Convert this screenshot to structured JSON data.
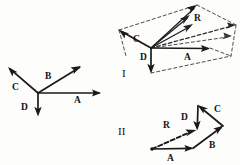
{
  "figure": {
    "kind": "hand-drawn-vector-diagram",
    "background_color": "#fdfdfc",
    "ink_color": "#1a1a1a",
    "panel_count": 3,
    "panels": [
      {
        "id": "panel-left",
        "caption": "",
        "description": "Four vectors A, B, C, D drawn from a common origin (tail-to-tail star arrangement)",
        "origin": {
          "x": 38,
          "y": 93
        },
        "vectors": [
          {
            "name": "A",
            "label": "A",
            "label_x": 74,
            "label_y": 103,
            "from": {
              "x": 38,
              "y": 93
            },
            "to": {
              "x": 101,
              "y": 93
            },
            "style": "solid",
            "direction_deg": 0
          },
          {
            "name": "B",
            "label": "B",
            "label_x": 45,
            "label_y": 79,
            "from": {
              "x": 38,
              "y": 93
            },
            "to": {
              "x": 81,
              "y": 66
            },
            "style": "solid",
            "direction_deg": 32
          },
          {
            "name": "C",
            "label": "C",
            "label_x": 12,
            "label_y": 90,
            "from": {
              "x": 38,
              "y": 93
            },
            "to": {
              "x": 8,
              "y": 67
            },
            "style": "solid",
            "direction_deg": 139
          },
          {
            "name": "D",
            "label": "D",
            "label_x": 22,
            "label_y": 110,
            "from": {
              "x": 38,
              "y": 93
            },
            "to": {
              "x": 38,
              "y": 116
            },
            "style": "solid",
            "direction_deg": 270
          }
        ]
      },
      {
        "id": "panel-one",
        "caption": "I",
        "caption_x": 122,
        "caption_y": 76,
        "description": "Parallelepiped construction: vectors A, C, D from a common origin with dashed construction lines and resultant R to the far corner",
        "origin": {
          "x": 151,
          "y": 48
        },
        "vectors": [
          {
            "name": "A",
            "label": "A",
            "label_x": 184,
            "label_y": 60,
            "from": {
              "x": 151,
              "y": 48
            },
            "to": {
              "x": 210,
              "y": 48
            },
            "style": "solid"
          },
          {
            "name": "C",
            "label": "C",
            "label_x": 133,
            "label_y": 42,
            "from": {
              "x": 151,
              "y": 48
            },
            "to": {
              "x": 119,
              "y": 30
            },
            "style": "solid"
          },
          {
            "name": "D",
            "label": "D",
            "label_x": 142,
            "label_y": 60,
            "from": {
              "x": 151,
              "y": 48
            },
            "to": {
              "x": 151,
              "y": 73
            },
            "style": "solid"
          },
          {
            "name": "R",
            "label": "R",
            "label_x": 194,
            "label_y": 21,
            "from": {
              "x": 151,
              "y": 48
            },
            "to": {
              "x": 197,
              "y": 5
            },
            "style": "solid-thin"
          }
        ],
        "extra_rays": [
          {
            "name": "ray-upper-1",
            "from": {
              "x": 151,
              "y": 48
            },
            "to": {
              "x": 190,
              "y": 15
            },
            "style": "solid-thin"
          },
          {
            "name": "ray-upper-2",
            "from": {
              "x": 151,
              "y": 48
            },
            "to": {
              "x": 193,
              "y": 24
            },
            "style": "solid-thin"
          },
          {
            "name": "ray-right-dashed",
            "from": {
              "x": 151,
              "y": 48
            },
            "to": {
              "x": 236,
              "y": 25
            },
            "style": "dashed-mid"
          },
          {
            "name": "ray-right-dashed-2",
            "from": {
              "x": 151,
              "y": 48
            },
            "to": {
              "x": 232,
              "y": 36
            },
            "style": "dashed"
          }
        ],
        "construction_edges": [
          {
            "name": "edge-top-back",
            "from": {
              "x": 119,
              "y": 30
            },
            "to": {
              "x": 197,
              "y": 5
            }
          },
          {
            "name": "edge-top-right",
            "from": {
              "x": 197,
              "y": 5
            },
            "to": {
              "x": 236,
              "y": 25
            }
          },
          {
            "name": "edge-right-down",
            "from": {
              "x": 236,
              "y": 25
            },
            "to": {
              "x": 231,
              "y": 56
            }
          },
          {
            "name": "edge-bottom-right",
            "from": {
              "x": 210,
              "y": 48
            },
            "to": {
              "x": 231,
              "y": 56
            }
          },
          {
            "name": "edge-left-down",
            "from": {
              "x": 119,
              "y": 30
            },
            "to": {
              "x": 151,
              "y": 48
            }
          },
          {
            "name": "edge-front-bottom",
            "from": {
              "x": 151,
              "y": 73
            },
            "to": {
              "x": 231,
              "y": 56
            }
          },
          {
            "name": "edge-inner-diag",
            "from": {
              "x": 151,
              "y": 48
            },
            "to": {
              "x": 210,
              "y": 48
            }
          }
        ]
      },
      {
        "id": "panel-two",
        "caption": "II",
        "caption_x": 120,
        "caption_y": 134,
        "description": "Head-to-tail polygon addition: A then B then C then D, with dashed resultant R from start point to the head of D",
        "start": {
          "x": 152,
          "y": 149
        },
        "vectors": [
          {
            "name": "A",
            "label": "A",
            "label_x": 168,
            "label_y": 161,
            "from": {
              "x": 152,
              "y": 149
            },
            "to": {
              "x": 193,
              "y": 148
            },
            "style": "solid"
          },
          {
            "name": "B",
            "label": "B",
            "label_x": 211,
            "label_y": 148,
            "from": {
              "x": 193,
              "y": 148
            },
            "to": {
              "x": 223,
              "y": 126
            },
            "style": "solid"
          },
          {
            "name": "C",
            "label": "C",
            "label_x": 215,
            "label_y": 111,
            "from": {
              "x": 223,
              "y": 126
            },
            "to": {
              "x": 198,
              "y": 105
            },
            "style": "solid"
          },
          {
            "name": "D",
            "label": "D",
            "label_x": 183,
            "label_y": 120,
            "from": {
              "x": 198,
              "y": 105
            },
            "to": {
              "x": 197,
              "y": 130
            },
            "style": "solid"
          },
          {
            "name": "R",
            "label": "R",
            "label_x": 165,
            "label_y": 127,
            "from": {
              "x": 152,
              "y": 149
            },
            "to": {
              "x": 196,
              "y": 130
            },
            "style": "dashed-bold"
          }
        ]
      }
    ],
    "labels_legend": {
      "A": "vector A",
      "B": "vector B",
      "C": "vector C",
      "D": "vector D",
      "R": "resultant vector R",
      "I": "figure I",
      "II": "figure II"
    }
  }
}
